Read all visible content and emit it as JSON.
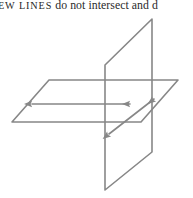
{
  "page": {
    "width": 193,
    "height": 198,
    "background_color": "#ffffff"
  },
  "caption": {
    "fragment_small_caps": "EW LINES",
    "fragment_body": " do not intersect and d",
    "full_visible_text": "EW LINES do not intersect and d",
    "note": "text is cropped at both left and right page edges",
    "text_color": "#2b2b2b"
  },
  "figure": {
    "stroke_color": "#878787",
    "stroke_width": 1.6,
    "shapes": {
      "horizontal_plane": {
        "name": "horizontal-plane",
        "points": "49,80 178,80 141,122 12,122"
      },
      "vertical_plane": {
        "name": "vertical-plane",
        "points": "105,65 152,19 152,152 105,190"
      },
      "horizontal_line": {
        "name": "horizontal-skew-line",
        "x1": 32,
        "y1": 104,
        "x2": 130,
        "y2": 104
      },
      "diagonal_line": {
        "name": "diagonal-skew-line",
        "x1": 109,
        "y1": 134,
        "x2": 154,
        "y2": 99
      }
    },
    "arrowheads": [
      {
        "name": "arrowhead-left",
        "direction": "west"
      },
      {
        "name": "arrowhead-right",
        "direction": "east"
      },
      {
        "name": "arrowhead-upper-right",
        "direction": "northeast"
      },
      {
        "name": "arrowhead-lower-left",
        "direction": "southwest"
      }
    ]
  }
}
